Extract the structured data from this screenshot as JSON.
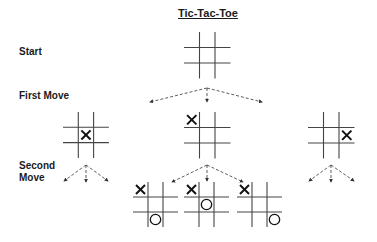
{
  "title": "Tic-Tac-Toe",
  "labels": {
    "start": "Start",
    "first_move": "First Move",
    "second_move_line1": "Second",
    "second_move_line2": "Move"
  },
  "boards": [
    {
      "id": "start",
      "x": 184,
      "y": 32,
      "cell": 15.5,
      "marks": []
    },
    {
      "id": "first-center",
      "x": 63,
      "y": 112,
      "cell": 15.3,
      "marks": [
        {
          "type": "X",
          "row": 1,
          "col": 1
        }
      ]
    },
    {
      "id": "first-corner",
      "x": 184,
      "y": 112,
      "cell": 15.5,
      "marks": [
        {
          "type": "X",
          "row": 0,
          "col": 0
        }
      ]
    },
    {
      "id": "first-edge",
      "x": 308,
      "y": 112,
      "cell": 15.5,
      "marks": [
        {
          "type": "X",
          "row": 1,
          "col": 2
        }
      ]
    },
    {
      "id": "second-1",
      "x": 133,
      "y": 182,
      "cell": 15,
      "marks": [
        {
          "type": "X",
          "row": 0,
          "col": 0
        },
        {
          "type": "O",
          "row": 2,
          "col": 1
        }
      ]
    },
    {
      "id": "second-2",
      "x": 184,
      "y": 182,
      "cell": 15,
      "marks": [
        {
          "type": "X",
          "row": 0,
          "col": 0
        },
        {
          "type": "O",
          "row": 1,
          "col": 1
        }
      ]
    },
    {
      "id": "second-3",
      "x": 237,
      "y": 182,
      "cell": 15,
      "marks": [
        {
          "type": "X",
          "row": 0,
          "col": 0
        },
        {
          "type": "O",
          "row": 2,
          "col": 2
        }
      ]
    }
  ],
  "arrow_groups": [
    {
      "apex": [
        207,
        88
      ],
      "targets": [
        [
          150,
          102
        ],
        [
          207,
          102
        ],
        [
          262,
          102
        ]
      ]
    },
    {
      "apex": [
        86,
        165
      ],
      "targets": [
        [
          64,
          181
        ],
        [
          86,
          182
        ],
        [
          108,
          181
        ]
      ]
    },
    {
      "apex": [
        207,
        165
      ],
      "targets": [
        [
          172,
          182
        ],
        [
          207,
          181
        ],
        [
          243,
          182
        ]
      ]
    },
    {
      "apex": [
        331,
        165
      ],
      "targets": [
        [
          309,
          181
        ],
        [
          331,
          182
        ],
        [
          354,
          181
        ]
      ]
    }
  ]
}
